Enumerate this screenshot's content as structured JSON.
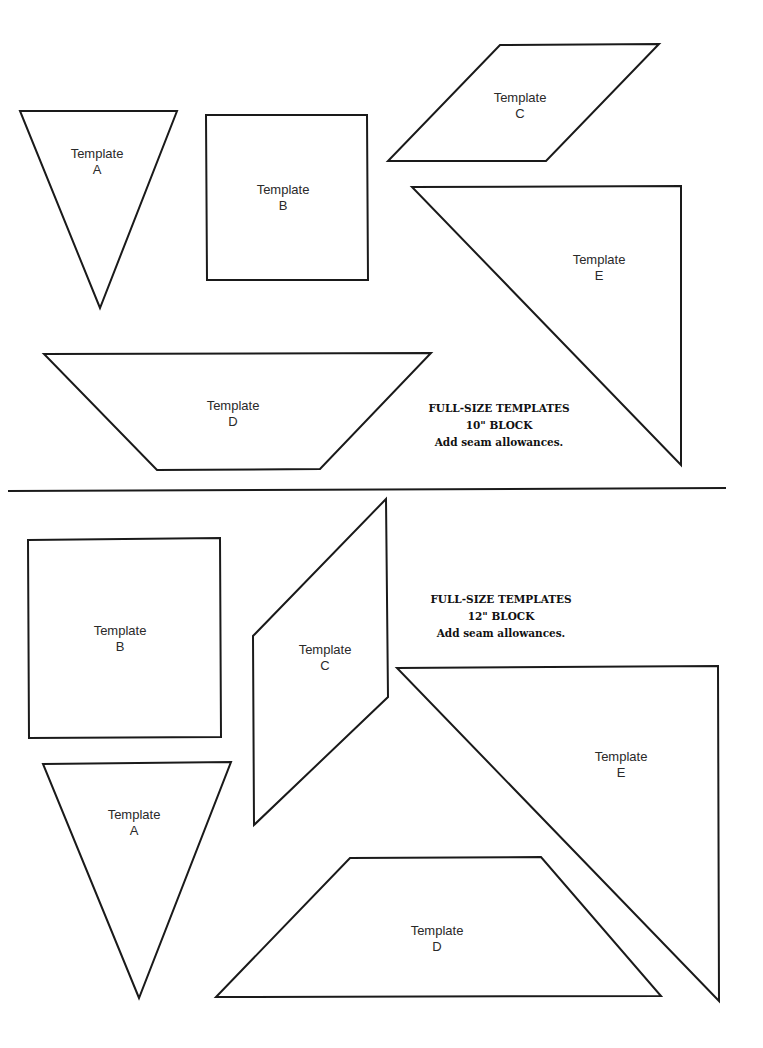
{
  "sections": [
    {
      "id": "10in",
      "note": {
        "line1": "FULL-SIZE TEMPLATES",
        "line2": "10\" BLOCK",
        "line3": "Add seam allowances."
      },
      "templates": [
        {
          "name": "Template",
          "letter": "A",
          "shape": "inverted-triangle",
          "points": "20,111 177,111 100,308",
          "label_x": 97,
          "label_y": 146
        },
        {
          "name": "Template",
          "letter": "B",
          "shape": "square",
          "points": "206,115 367,115 368,280 207,280",
          "label_x": 283,
          "label_y": 182
        },
        {
          "name": "Template",
          "letter": "C",
          "shape": "parallelogram",
          "points": "500,45 659,44 546,161 388,161",
          "label_x": 520,
          "label_y": 90
        },
        {
          "name": "Template",
          "letter": "D",
          "shape": "trapezoid",
          "points": "44,354 431,353 320,469 157,470",
          "label_x": 233,
          "label_y": 398
        },
        {
          "name": "Template",
          "letter": "E",
          "shape": "right-triangle",
          "points": "412,187 681,186 681,465",
          "label_x": 599,
          "label_y": 252
        }
      ]
    },
    {
      "id": "12in",
      "note": {
        "line1": "FULL-SIZE TEMPLATES",
        "line2": "12\" BLOCK",
        "line3": "Add seam allowances."
      },
      "templates": [
        {
          "name": "Template",
          "letter": "B",
          "shape": "square",
          "points": "28,540 220,538 221,737 29,738",
          "label_x": 120,
          "label_y": 623
        },
        {
          "name": "Template",
          "letter": "C",
          "shape": "parallelogram",
          "points": "386,499 388,697 254,825 253,636",
          "label_x": 325,
          "label_y": 642
        },
        {
          "name": "Template",
          "letter": "A",
          "shape": "inverted-triangle",
          "points": "43,764 231,762 139,998",
          "label_x": 134,
          "label_y": 807
        },
        {
          "name": "Template",
          "letter": "D",
          "shape": "trapezoid",
          "points": "350,858 541,857 661,996 216,997",
          "label_x": 437,
          "label_y": 923
        },
        {
          "name": "Template",
          "letter": "E",
          "shape": "right-triangle",
          "points": "397,668 718,666 719,1001",
          "label_x": 621,
          "label_y": 749
        }
      ]
    }
  ]
}
